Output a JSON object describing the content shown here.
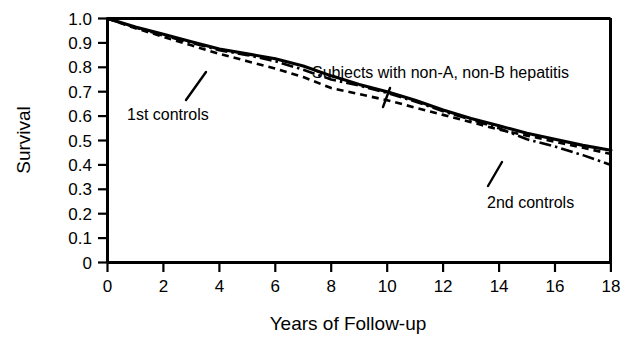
{
  "chart_data": {
    "type": "line",
    "title": "",
    "xlabel": "Years of Follow-up",
    "ylabel": "Survival",
    "xlim": [
      0,
      18
    ],
    "ylim": [
      0,
      1.0
    ],
    "grid": false,
    "legend_position": "inline-annotations",
    "x_ticks": [
      0,
      2,
      4,
      6,
      8,
      10,
      12,
      14,
      16,
      18
    ],
    "x_tick_labels": [
      "0",
      "2",
      "4",
      "6",
      "8",
      "10",
      "12",
      "14",
      "16",
      "18"
    ],
    "y_ticks": [
      0,
      0.1,
      0.2,
      0.3,
      0.4,
      0.5,
      0.6,
      0.7,
      0.8,
      0.9,
      1.0
    ],
    "y_tick_labels": [
      "0",
      "0.1",
      "0.2",
      "0.3",
      "0.4",
      "0.5",
      "0.6",
      "0.7",
      "0.8",
      "0.9",
      "1.0"
    ],
    "x": [
      0,
      1,
      2,
      3,
      4,
      5,
      6,
      7,
      8,
      9,
      10,
      11,
      12,
      13,
      14,
      15,
      16,
      17,
      18
    ],
    "series": [
      {
        "name": "Subjects with non-A, non-B hepatitis",
        "style": "solid",
        "color": "#000000",
        "values": [
          1.0,
          0.965,
          0.935,
          0.905,
          0.875,
          0.855,
          0.835,
          0.805,
          0.765,
          0.73,
          0.7,
          0.665,
          0.625,
          0.59,
          0.56,
          0.53,
          0.505,
          0.48,
          0.46
        ]
      },
      {
        "name": "1st controls",
        "style": "dashed",
        "color": "#000000",
        "values": [
          1.0,
          0.96,
          0.925,
          0.89,
          0.855,
          0.825,
          0.795,
          0.76,
          0.715,
          0.69,
          0.665,
          0.635,
          0.605,
          0.575,
          0.545,
          0.52,
          0.495,
          0.47,
          0.445
        ]
      },
      {
        "name": "2nd controls",
        "style": "dash-dot",
        "color": "#000000",
        "values": [
          1.0,
          0.963,
          0.93,
          0.9,
          0.87,
          0.85,
          0.825,
          0.79,
          0.75,
          0.725,
          0.695,
          0.66,
          0.62,
          0.585,
          0.55,
          0.505,
          0.475,
          0.44,
          0.4
        ]
      }
    ],
    "annotations": [
      {
        "label": "1st controls",
        "x_px": 127,
        "y_px": 104,
        "anchor": "start"
      },
      {
        "label": "Subjects with non-A, non-B hepatitis",
        "x_px": 312,
        "y_px": 75,
        "anchor": "start"
      },
      {
        "label": "2nd controls",
        "x_px": 487,
        "y_px": 195,
        "anchor": "start"
      }
    ]
  },
  "axes": {
    "y_title": "Survival",
    "x_title": "Years of Follow-up"
  },
  "annotations": {
    "first_controls": "1st controls",
    "subjects": "Subjects with non-A, non-B hepatitis",
    "second_controls": "2nd controls"
  },
  "ticks": {
    "y": [
      "1.0",
      "0.9",
      "0.8",
      "0.7",
      "0.6",
      "0.5",
      "0.4",
      "0.3",
      "0.2",
      "0.1",
      "0"
    ],
    "x": [
      "0",
      "2",
      "4",
      "6",
      "8",
      "10",
      "12",
      "14",
      "16",
      "18"
    ]
  },
  "colors": {
    "ink": "#000000",
    "background": "#ffffff"
  }
}
